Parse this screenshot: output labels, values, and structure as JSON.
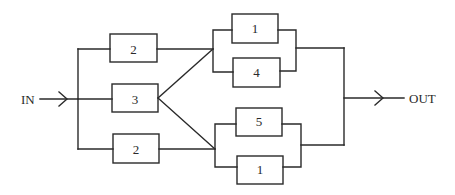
{
  "diagram": {
    "type": "reliability-block-diagram",
    "input_label": "IN",
    "output_label": "OUT",
    "blocks": [
      {
        "id": "b-top-left",
        "label": "2"
      },
      {
        "id": "b-mid-left",
        "label": "3"
      },
      {
        "id": "b-bot-left",
        "label": "2"
      },
      {
        "id": "b-upper-1",
        "label": "1"
      },
      {
        "id": "b-upper-4",
        "label": "4"
      },
      {
        "id": "b-lower-5",
        "label": "5"
      },
      {
        "id": "b-lower-1",
        "label": "1"
      }
    ],
    "colors": {
      "stroke": "#2a2a2a",
      "background": "#ffffff"
    }
  }
}
